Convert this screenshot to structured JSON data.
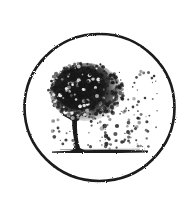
{
  "image": {
    "width": 189,
    "height": 200,
    "background": "#ffffff",
    "description": "Circular emblem with a tree whose foliage disperses into particles"
  },
  "emblem": {
    "ring": {
      "cx": 99.5,
      "cy": 107.5,
      "rx": 75,
      "ry": 73.5,
      "stroke": "#1a1a1a",
      "stroke_width": 2.6
    },
    "ground": {
      "x1": 52,
      "x2": 148,
      "y": 151,
      "color": "#1e1e1e"
    },
    "trunk": {
      "color": "#1a1a1a"
    },
    "canopy": {
      "cx": 86,
      "cy": 92,
      "color": "#151515"
    },
    "particles": {
      "color": "#222222"
    }
  }
}
